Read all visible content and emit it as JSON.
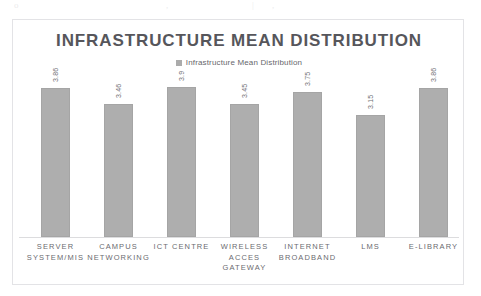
{
  "chart_data": {
    "type": "bar",
    "title": "INFRASTRUCTURE MEAN DISTRIBUTION",
    "xlabel": "",
    "ylabel": "",
    "ylim": [
      0,
      4.2
    ],
    "grid": false,
    "legend_position": "top-center",
    "legend": [
      "Infrastructure Mean Distribution"
    ],
    "categories": [
      "SERVER SYSTEM/MIS",
      "CAMPUS NETWORKING",
      "ICT CENTRE",
      "WIRELESS ACCES GATEWAY",
      "INTERNET BROADBAND",
      "LMS",
      "E-LIBRARY"
    ],
    "category_lines": [
      [
        "SERVER",
        "SYSTEM/MIS"
      ],
      [
        "CAMPUS",
        "NETWORKING"
      ],
      [
        "ICT CENTRE"
      ],
      [
        "WIRELESS",
        "ACCES",
        "GATEWAY"
      ],
      [
        "INTERNET",
        "BROADBAND"
      ],
      [
        "LMS"
      ],
      [
        "E-LIBRARY"
      ]
    ],
    "values": [
      3.86,
      3.46,
      3.9,
      3.45,
      3.75,
      3.15,
      3.86
    ],
    "value_labels": [
      "3.86",
      "3.46",
      "3.9",
      "3.45",
      "3.75",
      "3.15",
      "3.86"
    ],
    "series": [
      {
        "name": "Infrastructure Mean Distribution",
        "values": [
          3.86,
          3.46,
          3.9,
          3.45,
          3.75,
          3.15,
          3.86
        ]
      }
    ]
  },
  "legend": {
    "swatch_name": "legend-square",
    "label": "Infrastructure Mean Distribution"
  },
  "colors": {
    "bar_fill": "#a8a8a8",
    "bar_stroke": "#9e9e9e",
    "title_text": "#4a4a4f",
    "axis_text": "#5a5a5f",
    "frame_border": "#e3e3e6",
    "baseline": "#dcdcde",
    "page_background": "#ffffff"
  }
}
